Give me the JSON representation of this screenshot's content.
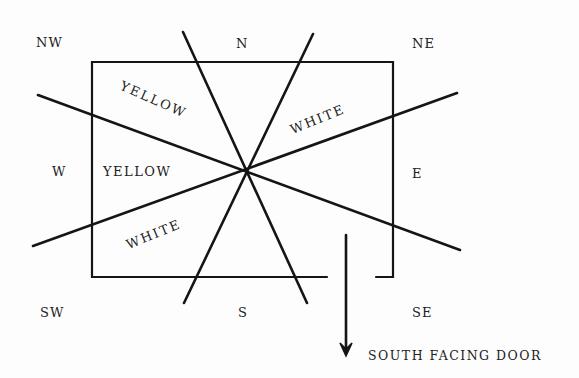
{
  "directions": {
    "nw": "NW",
    "n": "N",
    "ne": "NE",
    "w": "W",
    "e": "E",
    "sw": "SW",
    "s": "S",
    "se": "SE"
  },
  "sectors": {
    "nw_upper": "YELLOW",
    "w": "YELLOW",
    "ne": "WHITE",
    "sw": "WHITE"
  },
  "door_label": "SOUTH FACING DOOR",
  "icons": {
    "door_arrow": "arrow-down-icon"
  },
  "colors": {
    "line": "#151515",
    "text": "#222222",
    "background": "#fdfdfd"
  }
}
